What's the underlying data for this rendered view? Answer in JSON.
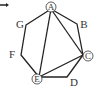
{
  "diagram": {
    "type": "heptagon-with-diagonals",
    "vertices": [
      {
        "id": "A",
        "label": "A",
        "circled": true
      },
      {
        "id": "B",
        "label": "B",
        "circled": false
      },
      {
        "id": "C",
        "label": "C",
        "circled": true
      },
      {
        "id": "D",
        "label": "D",
        "circled": false
      },
      {
        "id": "E",
        "label": "E",
        "circled": true
      },
      {
        "id": "F",
        "label": "F",
        "circled": false
      },
      {
        "id": "G",
        "label": "G",
        "circled": false
      }
    ],
    "diagonals": [
      [
        "A",
        "E"
      ],
      [
        "A",
        "C"
      ],
      [
        "E",
        "C"
      ]
    ],
    "colors": {
      "stroke": "#222222",
      "text": "#333333",
      "background": "#ffffff"
    }
  }
}
